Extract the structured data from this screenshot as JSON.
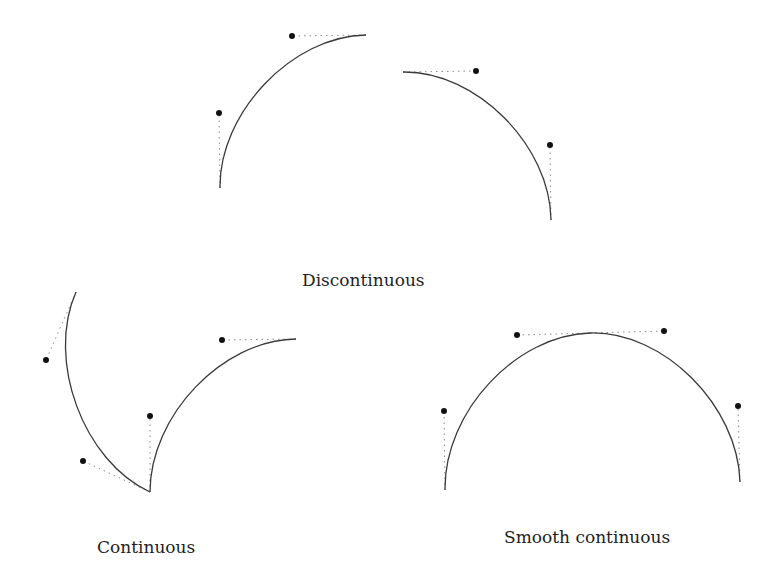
{
  "labels": {
    "discontinuous": "Discontinuous",
    "continuous": "Continuous",
    "smooth": "Smooth continuous"
  },
  "colors": {
    "curve": "#3a3a3a",
    "handle": "#8a8a8a",
    "control_point": "#111111",
    "background": "#ffffff"
  },
  "figures": [
    {
      "name": "discontinuous",
      "segments": [
        {
          "p0": [
            220,
            188
          ],
          "c1": [
            219,
            113
          ],
          "c2": [
            292,
            36
          ],
          "p1": [
            366,
            35
          ]
        },
        {
          "p0": [
            403,
            72
          ],
          "c1": [
            476,
            71
          ],
          "c2": [
            550,
            145
          ],
          "p1": [
            551,
            220
          ]
        }
      ]
    },
    {
      "name": "continuous",
      "segments": [
        {
          "p0": [
            76,
            292
          ],
          "c1": [
            46,
            360
          ],
          "c2": [
            83,
            461
          ],
          "p1": [
            150,
            492
          ]
        },
        {
          "p0": [
            150,
            492
          ],
          "c1": [
            150,
            416
          ],
          "c2": [
            222,
            340
          ],
          "p1": [
            296,
            339
          ]
        }
      ]
    },
    {
      "name": "smooth-continuous",
      "segments": [
        {
          "p0": [
            445,
            490
          ],
          "c1": [
            444,
            411
          ],
          "c2": [
            517,
            335
          ],
          "p1": [
            590,
            333
          ]
        },
        {
          "p0": [
            590,
            333
          ],
          "c1": [
            664,
            331
          ],
          "c2": [
            738,
            406
          ],
          "p1": [
            740,
            482
          ]
        }
      ]
    }
  ]
}
